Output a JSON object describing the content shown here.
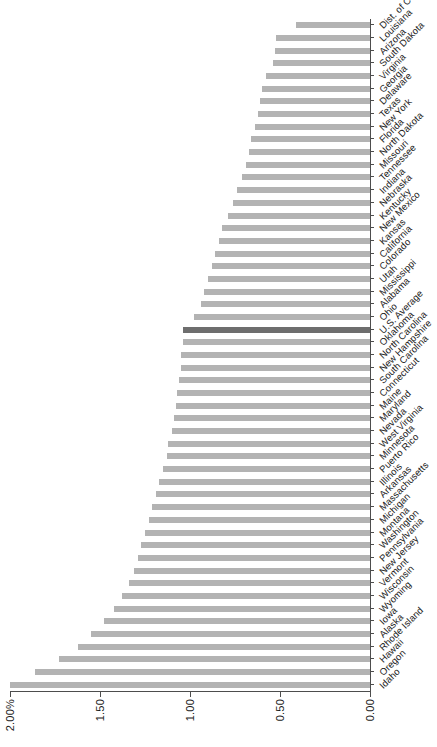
{
  "chart_data": {
    "type": "bar",
    "orientation": "vertical-rotated",
    "title": "",
    "subtitle": "",
    "xlabel": "",
    "ylabel": "",
    "ylim": [
      0,
      2.0
    ],
    "grid": false,
    "legend": null,
    "axis_tick_labels": [
      "2.00%",
      "1.50",
      "1.00",
      "0.50",
      "0.00"
    ],
    "axis_tick_values": [
      2.0,
      1.5,
      1.0,
      0.5,
      0.0
    ],
    "highlight_category": "U.S. Average",
    "colors": {
      "bar": "#b3b3b3",
      "highlight_bar": "#6e6e6e",
      "axis": "#4d4d4d",
      "text": "#1a1a1a",
      "background": "#ffffff"
    },
    "categories": [
      "Idaho",
      "Oregon",
      "Hawaii",
      "Rhode Island",
      "Alaska",
      "Iowa",
      "Wyoming",
      "Wisconsin",
      "Vermont",
      "New Jersey",
      "Pennsylvania",
      "Washington",
      "Montana",
      "Michigan",
      "Massachusetts",
      "Arkansas",
      "Illinois",
      "Puerto Rico",
      "Minnesota",
      "West Virginia",
      "Nevada",
      "Maryland",
      "Maine",
      "Connecticut",
      "South Carolina",
      "New Hampshire",
      "North Carolina",
      "Oklahoma",
      "U.S. Average",
      "Ohio",
      "Alabama",
      "Mississippi",
      "Utah",
      "Colorado",
      "California",
      "Kansas",
      "New Mexico",
      "Kentucky",
      "Nebraska",
      "Indiana",
      "Tennessee",
      "Missouri",
      "North Dakota",
      "Florida",
      "New York",
      "Texas",
      "Delaware",
      "Georgia",
      "Virginia",
      "South Dakota",
      "Arizona",
      "Louisiana",
      "Dist. of Columbia"
    ],
    "values": [
      2.0,
      1.86,
      1.73,
      1.62,
      1.55,
      1.48,
      1.42,
      1.38,
      1.34,
      1.31,
      1.29,
      1.27,
      1.25,
      1.23,
      1.21,
      1.19,
      1.17,
      1.15,
      1.13,
      1.12,
      1.1,
      1.09,
      1.08,
      1.07,
      1.06,
      1.05,
      1.05,
      1.04,
      1.04,
      0.98,
      0.94,
      0.92,
      0.9,
      0.88,
      0.86,
      0.84,
      0.82,
      0.79,
      0.76,
      0.74,
      0.71,
      0.69,
      0.67,
      0.66,
      0.64,
      0.62,
      0.61,
      0.6,
      0.58,
      0.54,
      0.53,
      0.52,
      0.41
    ]
  }
}
